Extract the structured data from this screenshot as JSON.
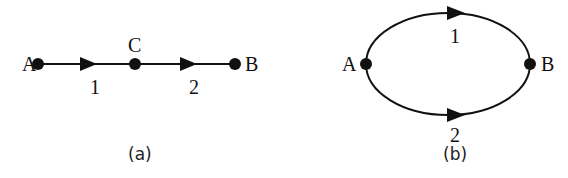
{
  "figure_a": {
    "caption": "(a)",
    "nodes": [
      {
        "id": "A",
        "label": "A"
      },
      {
        "id": "C",
        "label": "C"
      },
      {
        "id": "B",
        "label": "B"
      }
    ],
    "edges": [
      {
        "from": "A",
        "to": "C",
        "label": "1"
      },
      {
        "from": "C",
        "to": "B",
        "label": "2"
      }
    ],
    "topology": "series"
  },
  "figure_b": {
    "caption": "(b)",
    "nodes": [
      {
        "id": "A",
        "label": "A"
      },
      {
        "id": "B",
        "label": "B"
      }
    ],
    "edges": [
      {
        "from": "A",
        "to": "B",
        "label": "1",
        "path": "upper arc"
      },
      {
        "from": "A",
        "to": "B",
        "label": "2",
        "path": "lower arc"
      }
    ],
    "topology": "parallel"
  },
  "colors": {
    "stroke": "#111111",
    "background": "#ffffff"
  }
}
